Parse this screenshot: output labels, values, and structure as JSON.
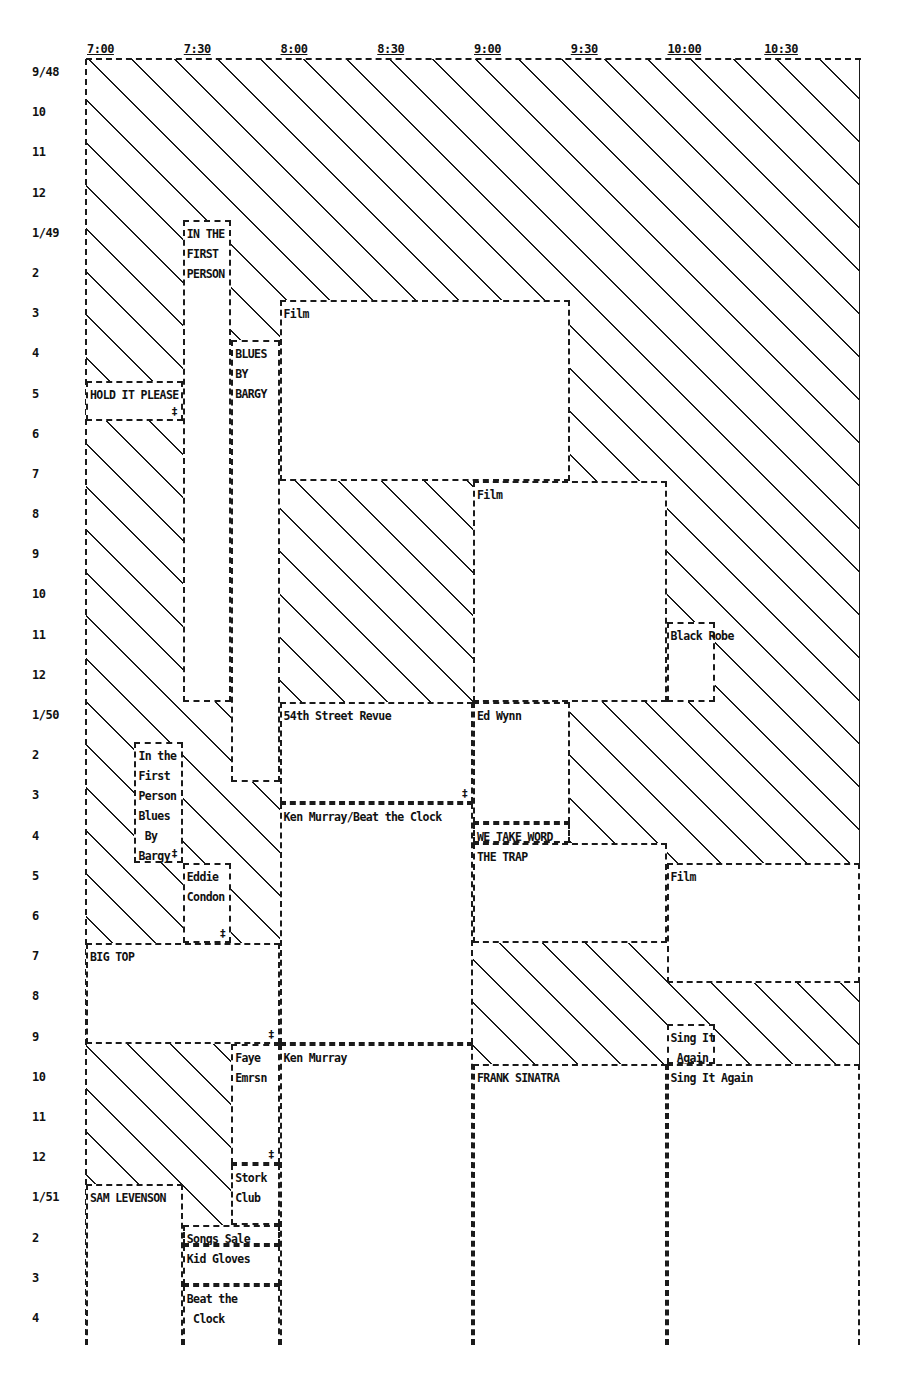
{
  "chart_data": {
    "type": "table",
    "title": "",
    "x_axis": {
      "labels": [
        "7:00",
        "7:30",
        "8:00",
        "8:30",
        "9:00",
        "9:30",
        "10:00",
        "10:30"
      ],
      "range": [
        "7:00",
        "11:00"
      ]
    },
    "y_axis": {
      "labels": [
        "9/48",
        "10",
        "11",
        "12",
        "1/49",
        "2",
        "3",
        "4",
        "5",
        "6",
        "7",
        "8",
        "9",
        "10",
        "11",
        "12",
        "1/50",
        "2",
        "3",
        "4",
        "5",
        "6",
        "7",
        "8",
        "9",
        "10",
        "11",
        "12",
        "1/51",
        "2",
        "3",
        "4"
      ],
      "range": [
        "9/48",
        "4/51"
      ]
    },
    "legend": {
      "hatched": "no program / unscheduled",
      "dagger_mark": "‡"
    },
    "programs": [
      {
        "id": "p01",
        "label": "IN THE\nFIRST\nPERSON",
        "start": "7:30",
        "end": "7:45",
        "from": "1/49",
        "to": "12/49",
        "mark": ""
      },
      {
        "id": "p02",
        "label": "BLUES\nBY\nBARGY",
        "start": "7:45",
        "end": "8:00",
        "from": "4/49",
        "to": "2/50",
        "mark": ""
      },
      {
        "id": "p03",
        "label": "HOLD IT PLEASE",
        "start": "7:00",
        "end": "7:30",
        "from": "5/49",
        "to": "5/49",
        "mark": "‡"
      },
      {
        "id": "p04",
        "label": "Film",
        "start": "8:00",
        "end": "9:30",
        "from": "3/49",
        "to": "7/49",
        "mark": ""
      },
      {
        "id": "p05",
        "label": "Film",
        "start": "9:00",
        "end": "10:00",
        "from": "7/49",
        "to": "12/49",
        "mark": ""
      },
      {
        "id": "p06",
        "label": "Black Robe",
        "start": "10:00",
        "end": "10:15",
        "from": "11/49",
        "to": "12/49",
        "mark": ""
      },
      {
        "id": "p07",
        "label": "54th Street Revue",
        "start": "8:00",
        "end": "9:00",
        "from": "1/50",
        "to": "3/50",
        "mark": "‡"
      },
      {
        "id": "p08",
        "label": "Ed Wynn",
        "start": "9:00",
        "end": "9:30",
        "from": "1/50",
        "to": "3/50",
        "mark": ""
      },
      {
        "id": "p09",
        "label": "In the\nFirst\nPerson\nBlues\n By\nBargy",
        "start": "7:15",
        "end": "7:30",
        "from": "2/50",
        "to": "4/50",
        "mark": "‡"
      },
      {
        "id": "p10",
        "label": "Ken Murray/Beat the Clock",
        "start": "8:00",
        "end": "9:00",
        "from": "3/50",
        "to": "9/50",
        "mark": ""
      },
      {
        "id": "p11",
        "label": "WE TAKE WORD",
        "start": "9:00",
        "end": "9:30",
        "from": "4/50",
        "to": "4/50",
        "mark": ""
      },
      {
        "id": "p12",
        "label": "THE TRAP",
        "start": "9:00",
        "end": "10:00",
        "from": "4/50",
        "to": "6/50",
        "mark": ""
      },
      {
        "id": "p13",
        "label": "Eddie\nCondon",
        "start": "7:30",
        "end": "7:45",
        "from": "5/50",
        "to": "6/50",
        "mark": "‡"
      },
      {
        "id": "p14",
        "label": "Film",
        "start": "10:00",
        "end": "11:00",
        "from": "5/50",
        "to": "7/50",
        "mark": ""
      },
      {
        "id": "p15",
        "label": "BIG TOP",
        "start": "7:00",
        "end": "8:00",
        "from": "7/50",
        "to": "9/50",
        "mark": "‡"
      },
      {
        "id": "p16",
        "label": "Sing It\n Again",
        "start": "10:00",
        "end": "10:15",
        "from": "9/50",
        "to": "9/50",
        "mark": ""
      },
      {
        "id": "p17",
        "label": "Faye\nEmrsn",
        "start": "7:45",
        "end": "8:00",
        "from": "9/50",
        "to": "12/50",
        "mark": "‡"
      },
      {
        "id": "p18",
        "label": "Ken Murray",
        "start": "8:00",
        "end": "9:00",
        "from": "9/50",
        "to": "4/51",
        "mark": ""
      },
      {
        "id": "p19",
        "label": "FRANK SINATRA",
        "start": "9:00",
        "end": "10:00",
        "from": "10/50",
        "to": "4/51",
        "mark": ""
      },
      {
        "id": "p20",
        "label": "Sing It Again",
        "start": "10:00",
        "end": "11:00",
        "from": "10/50",
        "to": "4/51",
        "mark": ""
      },
      {
        "id": "p21",
        "label": "Stork\nClub",
        "start": "7:45",
        "end": "8:00",
        "from": "12/50",
        "to": "1/51",
        "mark": ""
      },
      {
        "id": "p22",
        "label": "SAM LEVENSON",
        "start": "7:00",
        "end": "7:30",
        "from": "1/51",
        "to": "4/51",
        "mark": ""
      },
      {
        "id": "p23",
        "label": "Songs Sale",
        "start": "7:30",
        "end": "8:00",
        "from": "2/51",
        "to": "2/51",
        "mark": ""
      },
      {
        "id": "p24",
        "label": "Kid Gloves",
        "start": "7:30",
        "end": "8:00",
        "from": "2/51",
        "to": "3/51",
        "mark": ""
      },
      {
        "id": "p25",
        "label": "Beat the\n Clock",
        "start": "7:30",
        "end": "8:00",
        "from": "3/51",
        "to": "4/51",
        "mark": ""
      }
    ],
    "grid": false,
    "legend_position": "none"
  }
}
